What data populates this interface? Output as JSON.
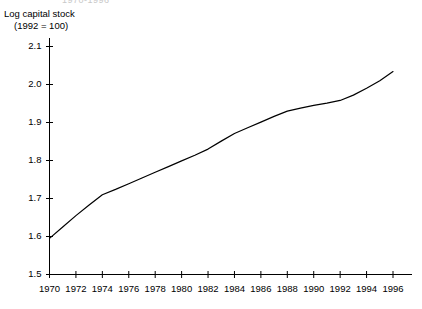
{
  "cut_header": {
    "text": "1970-1996"
  },
  "axis_title": {
    "line1": "Log capital stock",
    "line2": "(1992 = 100)"
  },
  "colors": {
    "line": "#000000",
    "axis": "#000000",
    "background": "#ffffff",
    "text": "#000000",
    "cut_header": "#c9c9c9"
  },
  "chart_data": {
    "type": "line",
    "title": "",
    "subtitle": "",
    "xlabel": "",
    "ylabel": "Log capital stock (1992 = 100)",
    "xlim": [
      1970,
      1996
    ],
    "ylim": [
      1.5,
      2.12
    ],
    "grid": false,
    "legend": false,
    "legend_position": "none",
    "x_ticks": [
      1970,
      1972,
      1974,
      1976,
      1978,
      1980,
      1982,
      1984,
      1986,
      1988,
      1990,
      1992,
      1994,
      1996
    ],
    "x_tick_labels": [
      "1970",
      "1972",
      "1974",
      "1976",
      "1978",
      "1980",
      "1982",
      "1984",
      "1986",
      "1988",
      "1990",
      "1992",
      "1994",
      "1996"
    ],
    "y_ticks": [
      1.5,
      1.6,
      1.7,
      1.8,
      1.9,
      2.0,
      2.1
    ],
    "y_tick_labels": [
      "1.5",
      "1.6",
      "1.7",
      "1.8",
      "1.9",
      "2.0",
      "2.1"
    ],
    "series": [
      {
        "name": "Log capital stock (1992 = 100)",
        "x": [
          1970,
          1971,
          1972,
          1973,
          1974,
          1975,
          1976,
          1977,
          1978,
          1979,
          1980,
          1981,
          1982,
          1983,
          1984,
          1985,
          1986,
          1987,
          1988,
          1989,
          1990,
          1991,
          1992,
          1993,
          1994,
          1995,
          1996
        ],
        "values": [
          1.595,
          1.625,
          1.655,
          1.683,
          1.71,
          1.724,
          1.739,
          1.754,
          1.769,
          1.784,
          1.799,
          1.814,
          1.83,
          1.851,
          1.871,
          1.886,
          1.901,
          1.916,
          1.93,
          1.938,
          1.945,
          1.951,
          1.958,
          1.972,
          1.99,
          2.01,
          2.034
        ]
      }
    ]
  }
}
